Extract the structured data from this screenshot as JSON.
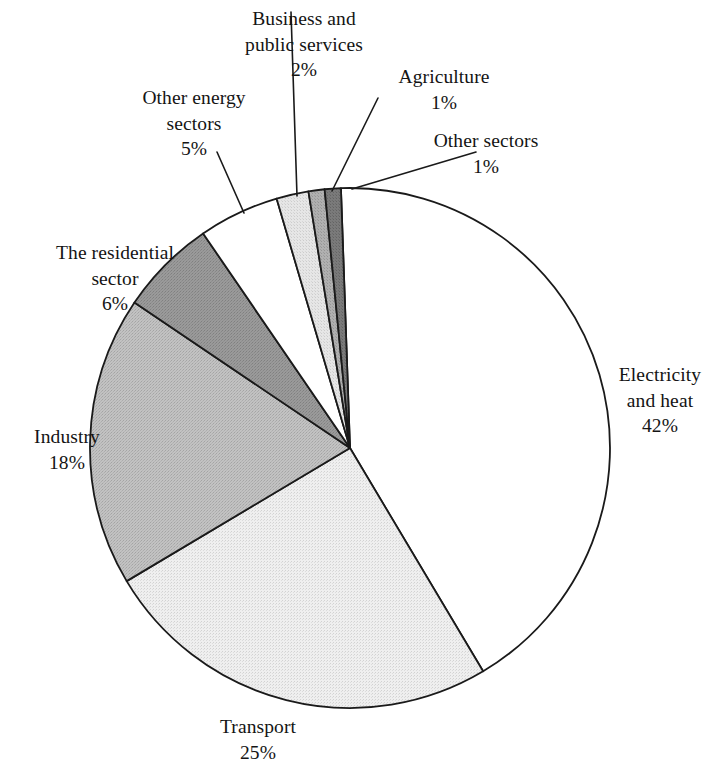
{
  "chart_data": {
    "type": "pie",
    "title": "",
    "subtitle": "",
    "xlabel": "",
    "ylabel": "",
    "legend_position": "none",
    "grid": false,
    "unit": "%",
    "start_angle_deg": -2,
    "direction": "clockwise",
    "categories": [
      "Electricity and heat",
      "Transport",
      "Industry",
      "The residential sector",
      "Other energy sectors",
      "Business and public services",
      "Agriculture",
      "Other sectors"
    ],
    "values": [
      42,
      25,
      18,
      6,
      5,
      2,
      1,
      1
    ],
    "slices": [
      {
        "id": "electricity",
        "name_lines": [
          "Electricity",
          "and heat"
        ],
        "name": "Electricity and heat",
        "value": 42,
        "value_label": "42%",
        "fill": "#ffffff",
        "stroke": "#1a1a1a"
      },
      {
        "id": "transport",
        "name_lines": [
          "Transport"
        ],
        "name": "Transport",
        "value": 25,
        "value_label": "25%",
        "fill": "#e8e8e8",
        "stroke": "#1a1a1a"
      },
      {
        "id": "industry",
        "name_lines": [
          "Industry"
        ],
        "name": "Industry",
        "value": 18,
        "value_label": "18%",
        "fill": "#b8b8b8",
        "stroke": "#1a1a1a"
      },
      {
        "id": "residential",
        "name_lines": [
          "The residential",
          "sector"
        ],
        "name": "The residential sector",
        "value": 6,
        "value_label": "6%",
        "fill": "#909090",
        "stroke": "#1a1a1a"
      },
      {
        "id": "other-energy",
        "name_lines": [
          "Other energy",
          "sectors"
        ],
        "name": "Other energy sectors",
        "value": 5,
        "value_label": "5%",
        "fill": "#ffffff",
        "stroke": "#1a1a1a"
      },
      {
        "id": "business",
        "name_lines": [
          "Business and",
          "public services"
        ],
        "name": "Business and public services",
        "value": 2,
        "value_label": "2%",
        "fill": "#e0e0e0",
        "stroke": "#1a1a1a"
      },
      {
        "id": "agriculture",
        "name_lines": [
          "Agriculture"
        ],
        "name": "Agriculture",
        "value": 1,
        "value_label": "1%",
        "fill": "#a8a8a8",
        "stroke": "#1a1a1a"
      },
      {
        "id": "other-sectors",
        "name_lines": [
          "Other sectors"
        ],
        "name": "Other sectors",
        "value": 1,
        "value_label": "1%",
        "fill": "#707070",
        "stroke": "#1a1a1a"
      }
    ]
  },
  "labels": {
    "electricity": {
      "line1": "Electricity",
      "line2": "and heat",
      "value": "42%"
    },
    "transport": {
      "line1": "Transport",
      "line2": "",
      "value": "25%"
    },
    "industry": {
      "line1": "Industry",
      "line2": "",
      "value": "18%"
    },
    "residential": {
      "line1": "The residential",
      "line2": "sector",
      "value": "6%"
    },
    "other_energy": {
      "line1": "Other energy",
      "line2": "sectors",
      "value": "5%"
    },
    "business": {
      "line1": "Business and",
      "line2": "public services",
      "value": "2%"
    },
    "agriculture": {
      "line1": "Agriculture",
      "line2": "",
      "value": "1%"
    },
    "other_sectors": {
      "line1": "Other sectors",
      "line2": "",
      "value": "1%"
    }
  }
}
